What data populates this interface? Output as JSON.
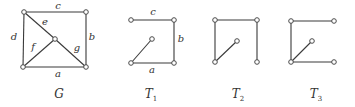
{
  "figure": {
    "graphs": [
      {
        "id": "G",
        "caption": "G",
        "caption_sub": "",
        "caption_pos": [
          59,
          98
        ],
        "vertices": {
          "tl": [
            24,
            12
          ],
          "tr": [
            86,
            12
          ],
          "bl": [
            23,
            67
          ],
          "br": [
            86,
            67
          ],
          "c": [
            55,
            39
          ]
        },
        "edges": [
          {
            "from": "tl",
            "to": "tr",
            "label": "c",
            "label_pos": [
              58,
              9
            ]
          },
          {
            "from": "tr",
            "to": "br",
            "label": "b",
            "label_pos": [
              92,
              40
            ]
          },
          {
            "from": "bl",
            "to": "br",
            "label": "a",
            "label_pos": [
              58,
              77
            ]
          },
          {
            "from": "tl",
            "to": "bl",
            "label": "d",
            "label_pos": [
              14,
              40
            ]
          },
          {
            "from": "tl",
            "to": "c",
            "label": "e",
            "label_pos": [
              45,
              25
            ]
          },
          {
            "from": "bl",
            "to": "c",
            "label": "f",
            "label_pos": [
              33,
              50
            ]
          },
          {
            "from": "c",
            "to": "br",
            "label": "g",
            "label_pos": [
              77,
              51
            ]
          }
        ]
      },
      {
        "id": "T1",
        "caption": "T",
        "caption_sub": "1",
        "caption_pos": [
          151,
          98
        ],
        "vertices": {
          "tl": [
            131,
            20
          ],
          "tr": [
            174,
            20
          ],
          "bl": [
            131,
            63
          ],
          "br": [
            174,
            63
          ],
          "c": [
            152,
            39
          ]
        },
        "edges": [
          {
            "from": "tl",
            "to": "tr",
            "label": "c",
            "label_pos": [
              153,
              15
            ]
          },
          {
            "from": "tr",
            "to": "br",
            "label": "b",
            "label_pos": [
              181,
              42
            ]
          },
          {
            "from": "bl",
            "to": "br",
            "label": "a",
            "label_pos": [
              152,
              73
            ]
          },
          {
            "from": "bl",
            "to": "c",
            "label": "",
            "label_pos": [
              0,
              0
            ]
          }
        ]
      },
      {
        "id": "T2",
        "caption": "T",
        "caption_sub": "2",
        "caption_pos": [
          238,
          98
        ],
        "vertices": {
          "tl": [
            215,
            20
          ],
          "tr": [
            257,
            20
          ],
          "bl": [
            215,
            62
          ],
          "br": [
            257,
            62
          ],
          "c": [
            237,
            41
          ]
        },
        "edges": [
          {
            "from": "tl",
            "to": "tr",
            "label": "",
            "label_pos": [
              0,
              0
            ]
          },
          {
            "from": "tl",
            "to": "bl",
            "label": "",
            "label_pos": [
              0,
              0
            ]
          },
          {
            "from": "tr",
            "to": "br",
            "label": "",
            "label_pos": [
              0,
              0
            ]
          },
          {
            "from": "bl",
            "to": "c",
            "label": "",
            "label_pos": [
              0,
              0
            ]
          }
        ]
      },
      {
        "id": "T3",
        "caption": "T",
        "caption_sub": "3",
        "caption_pos": [
          316,
          98
        ],
        "vertices": {
          "tl": [
            291,
            21
          ],
          "tr": [
            334,
            21
          ],
          "bl": [
            291,
            62
          ],
          "br": [
            334,
            62
          ],
          "c": [
            312,
            41
          ]
        },
        "edges": [
          {
            "from": "tl",
            "to": "tr",
            "label": "",
            "label_pos": [
              0,
              0
            ]
          },
          {
            "from": "tl",
            "to": "bl",
            "label": "",
            "label_pos": [
              0,
              0
            ]
          },
          {
            "from": "bl",
            "to": "br",
            "label": "",
            "label_pos": [
              0,
              0
            ]
          },
          {
            "from": "bl",
            "to": "c",
            "label": "",
            "label_pos": [
              0,
              0
            ]
          }
        ]
      }
    ],
    "colors": {
      "edge": "#3a3a3a",
      "vertex_stroke": "#4a4a4a",
      "vertex_fill": "#ffffff",
      "text": "#333333"
    }
  }
}
